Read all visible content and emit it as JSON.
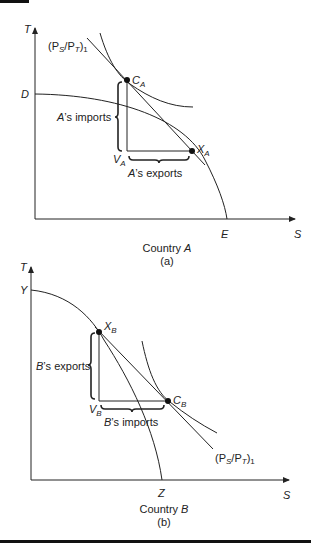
{
  "panel_a": {
    "axis_y": "T",
    "axis_x": "S",
    "intercept_y": "D",
    "intercept_x": "E",
    "consumption_point": {
      "base": "C",
      "sub": "A"
    },
    "production_point": {
      "base": "X",
      "sub": "A"
    },
    "vertex": {
      "base": "V",
      "sub": "A"
    },
    "price_line": {
      "open": "(P",
      "s": "S",
      "slash": "/P",
      "t": "T",
      "close": ")",
      "idx": "1"
    },
    "imports_label": {
      "country": "A",
      "rest": "’s imports"
    },
    "exports_label": {
      "country": "A",
      "rest": "’s exports"
    },
    "caption": {
      "prefix": "Country ",
      "country": "A",
      "letter": "(a)"
    }
  },
  "panel_b": {
    "axis_y": "T",
    "axis_x": "S",
    "intercept_y": "Y",
    "intercept_x": "Z",
    "consumption_point": {
      "base": "C",
      "sub": "B"
    },
    "production_point": {
      "base": "X",
      "sub": "B"
    },
    "vertex": {
      "base": "V",
      "sub": "B"
    },
    "price_line": {
      "open": "(P",
      "s": "S",
      "slash": "/P",
      "t": "T",
      "close": ")",
      "idx": "1"
    },
    "exports_label": {
      "country": "B",
      "rest": "’s exports"
    },
    "imports_label": {
      "country": "B",
      "rest": "’s imports"
    },
    "caption": {
      "prefix": "Country ",
      "country": "B",
      "letter": "(b)"
    }
  },
  "colors": {
    "ink": "#222222",
    "rule": "#111111"
  }
}
